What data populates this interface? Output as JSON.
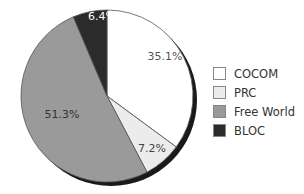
{
  "chart_data": {
    "type": "pie",
    "title": "",
    "categories": [
      "COCOM",
      "PRC",
      "Free World",
      "BLOC"
    ],
    "values": [
      35.1,
      7.2,
      51.3,
      6.4
    ],
    "labels": [
      "35.1%",
      "7.2%",
      "51.3%",
      "6.4%"
    ],
    "colors": [
      "#ffffff",
      "#ececec",
      "#9a9a9a",
      "#2b2b2b"
    ],
    "label_colors": [
      "#555555",
      "#444444",
      "#333333",
      "#ffffff"
    ],
    "start_angle_deg": 0,
    "direction": "clockwise",
    "legend_position": "right",
    "shadow": true
  },
  "legend": {
    "items": [
      {
        "label": "COCOM",
        "color": "#ffffff"
      },
      {
        "label": "PRC",
        "color": "#ececec"
      },
      {
        "label": "Free World",
        "color": "#9a9a9a"
      },
      {
        "label": "BLOC",
        "color": "#2b2b2b"
      }
    ]
  }
}
